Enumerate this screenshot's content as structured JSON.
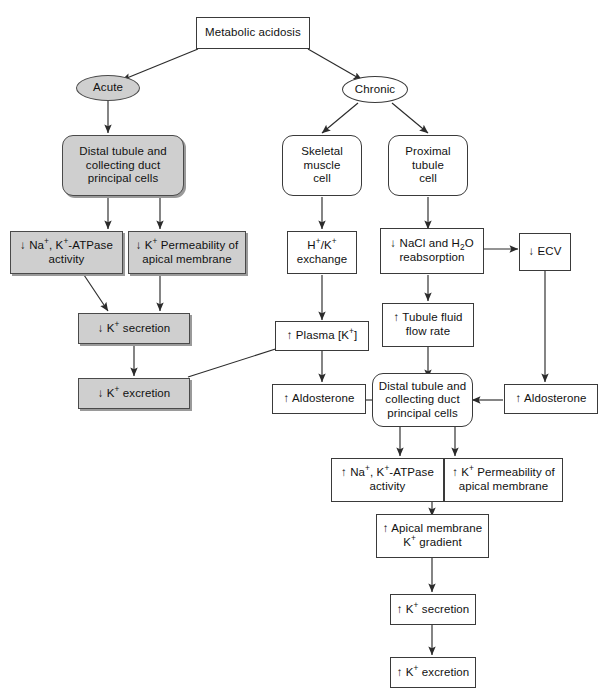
{
  "diagram": {
    "colors": {
      "gray_fill": "#cfcfcf",
      "white_fill": "#ffffff",
      "stroke": "#3a3a3a",
      "shadow": "#9a9a9a"
    },
    "nodes": {
      "metabolic_acidosis": "Metabolic acidosis",
      "acute": "Acute",
      "chronic": "Chronic",
      "acute_distal_tubule": "Distal tubule and\ncollecting duct\nprincipal cells",
      "skeletal_muscle_cell": "Skeletal\nmuscle\ncell",
      "proximal_tubule_cell": "Proximal\ntubule\ncell",
      "dec_na_k_atpase": "↓ Na+, K+-ATPase\nactivity",
      "dec_k_permeability": "↓ K+ Permeability of\napical membrane",
      "h_k_exchange": "H+/K+\nexchange",
      "dec_nacl_h2o": "↓ NaCl and H2O\nreabsorption",
      "dec_ecv": "↓ ECV",
      "dec_k_secretion": "↓ K+ secretion",
      "inc_plasma_k": "↑ Plasma [K+]",
      "inc_tubule_fluid_flow": "↑ Tubule fluid\nflow rate",
      "dec_k_excretion": "↓ K+ excretion",
      "inc_aldosterone_left": "↑ Aldosterone",
      "chronic_distal_tubule": "Distal tubule and\ncollecting duct\nprincipal cells",
      "inc_aldosterone_right": "↑ Aldosterone",
      "inc_na_k_atpase": "↑ Na+, K+-ATPase\nactivity",
      "inc_k_permeability": "↑ K+ Permeability of\napical membrane",
      "inc_apical_gradient": "↑ Apical membrane\nK+ gradient",
      "inc_k_secretion": "↑ K+ secretion",
      "inc_k_excretion": "↑ K+ excretion"
    },
    "caption": ""
  }
}
